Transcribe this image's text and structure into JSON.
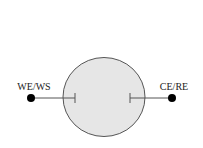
{
  "diagram": {
    "type": "electrochemical-cell",
    "cell": {
      "fill": "#e6e6e6",
      "stroke": "#555555"
    },
    "electrodes": [
      {
        "id": "left",
        "label": "WE/WS"
      },
      {
        "id": "right",
        "label": "CE/RE"
      }
    ],
    "colors": {
      "terminal": "#000000",
      "wire": "#555555"
    }
  }
}
